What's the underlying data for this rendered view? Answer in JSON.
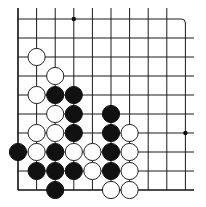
{
  "diagram": {
    "type": "go-board-fragment",
    "corner": "bottom-left",
    "grid": {
      "columns": 10,
      "rows": 10,
      "x": [
        18,
        36.6,
        55.2,
        73.8,
        92.4,
        111,
        129.6,
        148.2,
        166.8,
        185.4
      ],
      "y": [
        19,
        38,
        57,
        76,
        95,
        114,
        133,
        152,
        171,
        190
      ]
    },
    "star_points": [
      {
        "col": 3,
        "row": 0
      },
      {
        "col": 9,
        "row": 6
      }
    ],
    "stones": {
      "black": [
        {
          "col": 2,
          "row": 4
        },
        {
          "col": 3,
          "row": 4
        },
        {
          "col": 3,
          "row": 5
        },
        {
          "col": 5,
          "row": 5
        },
        {
          "col": 3,
          "row": 6
        },
        {
          "col": 5,
          "row": 6
        },
        {
          "col": 0,
          "row": 7
        },
        {
          "col": 2,
          "row": 7
        },
        {
          "col": 5,
          "row": 7
        },
        {
          "col": 1,
          "row": 8
        },
        {
          "col": 2,
          "row": 8
        },
        {
          "col": 3,
          "row": 8
        },
        {
          "col": 5,
          "row": 8
        },
        {
          "col": 2,
          "row": 9
        }
      ],
      "white": [
        {
          "col": 1,
          "row": 2
        },
        {
          "col": 2,
          "row": 3
        },
        {
          "col": 1,
          "row": 4
        },
        {
          "col": 2,
          "row": 5
        },
        {
          "col": 1,
          "row": 6
        },
        {
          "col": 2,
          "row": 6
        },
        {
          "col": 6,
          "row": 6
        },
        {
          "col": 1,
          "row": 7
        },
        {
          "col": 3,
          "row": 7
        },
        {
          "col": 4,
          "row": 7
        },
        {
          "col": 6,
          "row": 7
        },
        {
          "col": 4,
          "row": 8
        },
        {
          "col": 6,
          "row": 8
        },
        {
          "col": 5,
          "row": 9
        },
        {
          "col": 6,
          "row": 9
        }
      ]
    },
    "colors": {
      "black_stone": "#111111",
      "white_stone": "#ffffff",
      "line": "#1a1a1a",
      "background": "#ffffff"
    }
  }
}
